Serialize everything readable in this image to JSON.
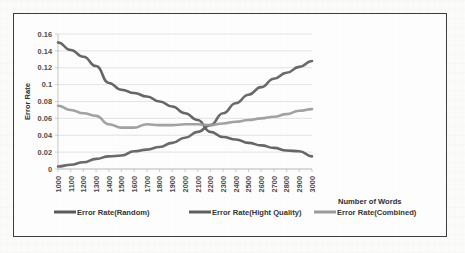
{
  "chart_data": {
    "type": "line",
    "title": "",
    "xlabel": "Number of Words",
    "ylabel": "Error Rate",
    "grid": true,
    "legend_position": "bottom",
    "xlim": [
      1000,
      3000
    ],
    "ylim": [
      0,
      0.16
    ],
    "ytick_labels": [
      "0",
      "0.02",
      "0.04",
      "0.06",
      "0.08",
      "0.1",
      "0.12",
      "0.14",
      "0.16"
    ],
    "ytick_values": [
      0,
      0.02,
      0.04,
      0.06,
      0.08,
      0.1,
      0.12,
      0.14,
      0.16
    ],
    "categories": [
      1000,
      1100,
      1200,
      1300,
      1400,
      1500,
      1600,
      1700,
      1800,
      1900,
      2000,
      2100,
      2200,
      2300,
      2400,
      2500,
      2600,
      2700,
      2800,
      2900,
      3000
    ],
    "xtick_labels": [
      "1000",
      "1100",
      "1200",
      "1300",
      "1400",
      "1500",
      "1600",
      "1700",
      "1800",
      "1900",
      "2000",
      "2100",
      "2200",
      "2300",
      "2400",
      "2500",
      "2600",
      "2700",
      "2800",
      "2900",
      "3000"
    ],
    "series": [
      {
        "name": "Error Rate(Random)",
        "color": "#5a5a5a",
        "values": [
          0.15,
          0.141,
          0.133,
          0.122,
          0.102,
          0.094,
          0.09,
          0.086,
          0.08,
          0.074,
          0.066,
          0.058,
          0.044,
          0.038,
          0.035,
          0.031,
          0.028,
          0.025,
          0.022,
          0.021,
          0.015
        ]
      },
      {
        "name": "Error Rate(Hight Quality)",
        "color": "#5f5f5f",
        "values": [
          0.003,
          0.005,
          0.008,
          0.012,
          0.015,
          0.016,
          0.021,
          0.023,
          0.026,
          0.031,
          0.037,
          0.044,
          0.052,
          0.066,
          0.078,
          0.088,
          0.097,
          0.107,
          0.114,
          0.121,
          0.128
        ]
      },
      {
        "name": "Error Rate(Combined)",
        "color": "#9b9b9b",
        "values": [
          0.075,
          0.07,
          0.066,
          0.063,
          0.053,
          0.049,
          0.049,
          0.053,
          0.052,
          0.052,
          0.053,
          0.053,
          0.052,
          0.054,
          0.056,
          0.058,
          0.06,
          0.062,
          0.065,
          0.069,
          0.071
        ]
      }
    ]
  },
  "legend": {
    "items": [
      {
        "label": "Error Rate(Random)",
        "color": "#5a5a5a"
      },
      {
        "label": "Error Rate(Hight Quality)",
        "color": "#5f5f5f"
      },
      {
        "label": "Error Rate(Combined)",
        "color": "#9b9b9b"
      }
    ]
  }
}
